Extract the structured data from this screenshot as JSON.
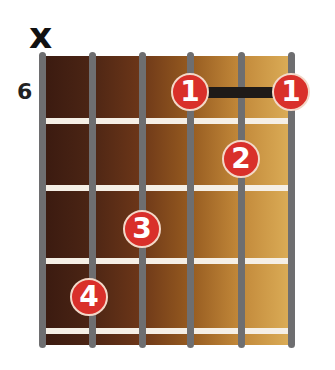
{
  "chord": {
    "muted_marker": "x",
    "start_fret_label": "6",
    "strings": 6,
    "frets_shown": 4,
    "colors": {
      "dot": "#d9302a",
      "barre": "#1e1a18",
      "string": "#6e6e70",
      "fret": "#f5efe6"
    },
    "fingers": [
      {
        "label": "1",
        "string": 4,
        "fret": 1
      },
      {
        "label": "1",
        "string": 6,
        "fret": 1
      },
      {
        "label": "2",
        "string": 5,
        "fret": 2
      },
      {
        "label": "3",
        "string": 3,
        "fret": 3
      },
      {
        "label": "4",
        "string": 2,
        "fret": 4
      }
    ],
    "barre": {
      "fret": 1,
      "from_string": 4,
      "to_string": 6
    }
  }
}
